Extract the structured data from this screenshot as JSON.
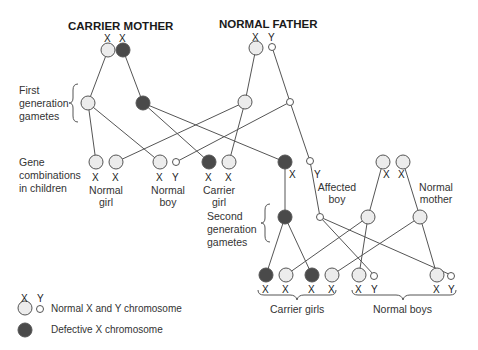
{
  "titles": {
    "mother": "CARRIER MOTHER",
    "father": "NORMAL FATHER"
  },
  "side_labels": {
    "first_gen": [
      "First",
      "generation",
      "gametes"
    ],
    "gene_comb": [
      "Gene",
      "combinations",
      "in children"
    ],
    "second_gen": [
      "Second",
      "generation",
      "gametes"
    ]
  },
  "children_labels": {
    "normal_girl": [
      "Normal",
      "girl"
    ],
    "normal_boy": [
      "Normal",
      "boy"
    ],
    "carrier_girl": [
      "Carrier",
      "girl"
    ],
    "affected_boy": [
      "Affected",
      "boy"
    ],
    "normal_mother": [
      "Normal",
      "mother"
    ]
  },
  "grandchildren_labels": {
    "carrier_girls": "Carrier girls",
    "normal_boys": "Normal boys"
  },
  "chrom": {
    "x": "X",
    "y": "Y"
  },
  "legend": {
    "x": "X",
    "y": "Y",
    "normal": "Normal X and Y chromosome",
    "defective": "Defective X chromosome"
  },
  "colors": {
    "normal_fill": "#ececec",
    "defective_fill": "#4a4a4a",
    "stroke": "#555555",
    "line": "#555555"
  }
}
